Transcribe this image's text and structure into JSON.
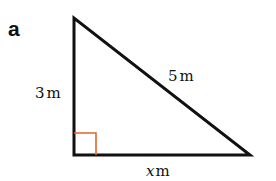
{
  "part_label": "a",
  "diagram": {
    "type": "right-triangle",
    "vertices": {
      "top": [
        74,
        18
      ],
      "bottom_left": [
        74,
        155
      ],
      "bottom_right": [
        250,
        155
      ]
    },
    "right_angle_color": "#e0662b",
    "stroke_color": "#111111"
  },
  "labels": {
    "vertical_side": {
      "value": "3",
      "unit": "m"
    },
    "hypotenuse": {
      "value": "5",
      "unit": "m"
    },
    "base": {
      "value": "x",
      "unit": "m"
    }
  }
}
